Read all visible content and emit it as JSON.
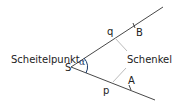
{
  "diagram": {
    "type": "angle",
    "labels": {
      "vertex_caption": "Scheitelpunkt",
      "vertex": "S",
      "angle": "α",
      "ray_upper": "q",
      "ray_lower": "p",
      "point_upper": "B",
      "point_lower": "A",
      "side_caption": "Schenkel"
    },
    "colors": {
      "line": "#333333",
      "leader": "#bbbbbb",
      "arc": "#1a3a6a"
    }
  }
}
